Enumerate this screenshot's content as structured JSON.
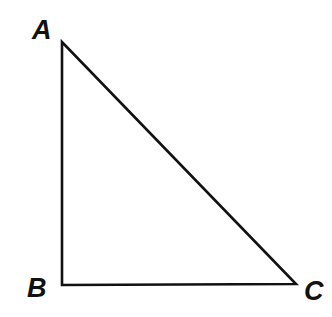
{
  "figure": {
    "kind": "geometry-diagram",
    "shape_name": "right-triangle",
    "background_color": "#ffffff",
    "stroke_color": "#111111",
    "stroke_width": 2.6,
    "canvas": {
      "width": 332,
      "height": 317
    },
    "vertices": [
      {
        "id": "A",
        "label": "A",
        "x": 62,
        "y": 42,
        "role": "apex"
      },
      {
        "id": "B",
        "label": "B",
        "x": 62,
        "y": 285,
        "role": "right-angle"
      },
      {
        "id": "C",
        "label": "C",
        "x": 296,
        "y": 284,
        "role": "base-right"
      }
    ],
    "edges": [
      {
        "id": "AB",
        "from": "A",
        "to": "B",
        "orientation": "vertical"
      },
      {
        "id": "BC",
        "from": "B",
        "to": "C",
        "orientation": "horizontal"
      },
      {
        "id": "CA",
        "from": "C",
        "to": "A",
        "orientation": "hypotenuse"
      }
    ],
    "labels": {
      "a": "A",
      "b": "B",
      "c": "C"
    }
  }
}
